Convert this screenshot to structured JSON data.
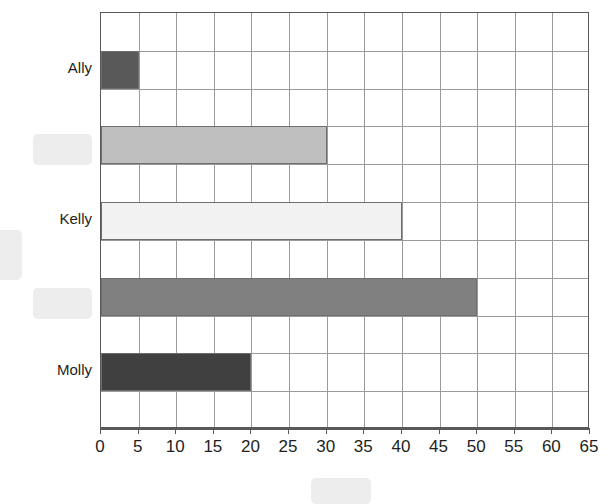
{
  "chart_data": {
    "type": "bar",
    "orientation": "horizontal",
    "title": "",
    "xlabel": "",
    "ylabel": "",
    "xlim": [
      0,
      65
    ],
    "xticks": [
      0,
      5,
      10,
      15,
      20,
      25,
      30,
      35,
      40,
      45,
      50,
      55,
      60,
      65
    ],
    "xtick_labels": [
      "0",
      "5",
      "10",
      "15",
      "20",
      "25",
      "30",
      "35",
      "40",
      "45",
      "50",
      "55",
      "60",
      "65"
    ],
    "grid": true,
    "legend": "none",
    "categories": [
      "Ally",
      "",
      "Kelly",
      "",
      "Molly"
    ],
    "values": [
      5,
      30,
      40,
      50,
      20
    ],
    "bar_colors": [
      "#595959",
      "#bfbfbf",
      "#f2f2f2",
      "#808080",
      "#404040"
    ],
    "bar_border_color": "#6d6e71",
    "bars": [
      {
        "label": "Ally",
        "value": 5,
        "color": "#595959",
        "label_hidden": false
      },
      {
        "label": "",
        "value": 30,
        "color": "#bfbfbf",
        "label_hidden": true
      },
      {
        "label": "Kelly",
        "value": 40,
        "color": "#f2f2f2",
        "label_hidden": false
      },
      {
        "label": "",
        "value": 50,
        "color": "#808080",
        "label_hidden": true
      },
      {
        "label": "Molly",
        "value": 20,
        "color": "#404040",
        "label_hidden": false
      }
    ]
  },
  "labels": {
    "ally": "Ally",
    "kelly": "Kelly",
    "molly": "Molly"
  },
  "axis": {
    "tick_0": "0",
    "tick_5": "5",
    "tick_10": "10",
    "tick_15": "15",
    "tick_20": "20",
    "tick_25": "25",
    "tick_30": "30",
    "tick_35": "35",
    "tick_40": "40",
    "tick_45": "45",
    "tick_50": "50",
    "tick_55": "55",
    "tick_60": "60",
    "tick_65": "65"
  },
  "redactions": {
    "color": "#ededed",
    "boxes": [
      {
        "name": "redaction-label-row2",
        "x": 33,
        "y": 134,
        "w": 59,
        "h": 31
      },
      {
        "name": "redaction-label-row4",
        "x": 33,
        "y": 288,
        "w": 59,
        "h": 31
      },
      {
        "name": "redaction-left-edge",
        "x": -12,
        "y": 230,
        "w": 34,
        "h": 50
      },
      {
        "name": "redaction-bottom-caption",
        "x": 311,
        "y": 478,
        "w": 60,
        "h": 26
      }
    ]
  },
  "style": {
    "plot_border_color": "#58595b",
    "grid_color": "#9a9a9a",
    "background": "#ffffff",
    "text_color": "#231f20"
  }
}
